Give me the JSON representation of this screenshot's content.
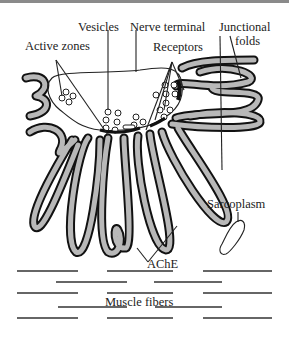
{
  "diagram": {
    "labels": {
      "vesicles": "Vesicles",
      "nerve_terminal": "Nerve terminal",
      "junctional_folds_line1": "Junctional",
      "junctional_folds_line2": "folds",
      "active_zones": "Active zones",
      "receptors": "Receptors",
      "sarcoplasm": "Sarcoplasm",
      "ache": "AChE",
      "muscle_fibers": "Muscle fibers"
    },
    "colors": {
      "outline": "#111111",
      "membrane_fill": "#b8b8b8",
      "background": "#ffffff",
      "top_border": "#8a8a8a"
    }
  }
}
